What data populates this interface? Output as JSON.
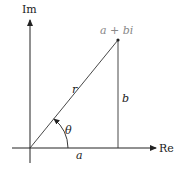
{
  "diagram": {
    "axes": {
      "x_label": "Re",
      "y_label": "Im"
    },
    "point_label": "a + bi",
    "segments": {
      "hypotenuse": "r",
      "vertical": "b",
      "horizontal": "a"
    },
    "angle_label": "θ"
  }
}
